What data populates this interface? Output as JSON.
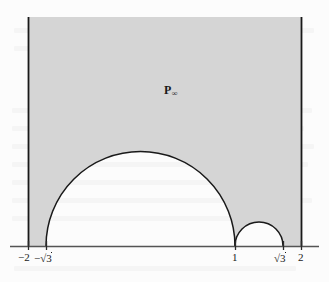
{
  "figure": {
    "kind": "hyperbolic-fundamental-domain",
    "region_label": {
      "base": "P",
      "subscript": "∞",
      "x": 164,
      "y": 84
    },
    "colors": {
      "shaded_fill": "#d6d6d6",
      "curve_stroke": "#1a1a1a",
      "axis_stroke": "#555555",
      "vertical_stroke": "#1a1a1a",
      "paper": "#fdfdfd",
      "text": "#1a1a1a"
    },
    "axis": {
      "y_pixel": 246,
      "x_start": 10,
      "x_end": 319,
      "tick_height": 7
    },
    "x_bounds": {
      "left_value": -2,
      "right_value": 2,
      "left_pixel": 28,
      "right_pixel": 302
    },
    "top_pixel": 17,
    "ticks": [
      {
        "id": "tick-minus-2",
        "label": "−2",
        "value": -2,
        "pixel": 28,
        "label_x": 20,
        "has_radical": false
      },
      {
        "id": "tick-minus-sqrt3",
        "label": "−√3",
        "value": -1.732,
        "pixel": 46,
        "label_x": 36,
        "has_radical": true,
        "radical_prefix": "−",
        "radical_body": "3"
      },
      {
        "id": "tick-one",
        "label": "1",
        "value": 1,
        "pixel": 235,
        "label_x": 232,
        "has_radical": false
      },
      {
        "id": "tick-sqrt3",
        "label": "√3",
        "value": 1.732,
        "pixel": 283,
        "label_x": 275,
        "has_radical": true,
        "radical_prefix": "",
        "radical_body": "3"
      },
      {
        "id": "tick-two",
        "label": "2",
        "value": 2,
        "pixel": 302,
        "label_x": 299,
        "has_radical": false
      }
    ],
    "vertical_boundaries": [
      {
        "id": "left-vertical-boundary",
        "x": 28,
        "y_top": 17,
        "y_bottom": 246
      },
      {
        "id": "right-vertical-boundary",
        "x": 302,
        "y_top": 17,
        "y_bottom": 246
      }
    ],
    "semicircles": [
      {
        "id": "large-semicircle",
        "left_pixel": 46,
        "right_pixel": 235,
        "center_pixel": 140.5,
        "radius_pixel": 94.5,
        "left_value": -1.732,
        "right_value": 1,
        "baseline_y": 246
      },
      {
        "id": "small-semicircle",
        "left_pixel": 235,
        "right_pixel": 283,
        "center_pixel": 259,
        "radius_pixel": 24,
        "left_value": 1,
        "right_value": 1.732,
        "baseline_y": 246
      }
    ]
  }
}
